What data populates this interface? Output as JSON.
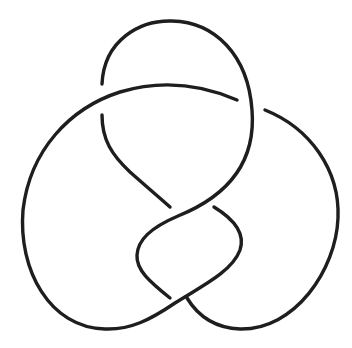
{
  "diagram": {
    "type": "knot-diagram",
    "title": "Figure-eight knot",
    "crossings": 4,
    "stroke_color": "#1e1e1e",
    "background": "#ffffff",
    "strands": [
      {
        "id": "top-loop",
        "d": "M102,84 C104,40 140,20 172,21 C215,22 248,55 252,110 C256,160 230,195 178,216 C150,228 138,240 137,255 C136,270 150,282 170,298"
      },
      {
        "id": "upper-arc",
        "d": "M237,100 C200,84 160,80 120,92 C70,108 30,150 23,210 C18,270 50,328 105,329 C130,330 150,320 175,303 C200,287 232,272 240,250 C246,232 232,218 214,207"
      },
      {
        "id": "left-inner",
        "d": "M102,115 C102,140 112,155 130,172 C148,188 160,198 170,207"
      },
      {
        "id": "right-arc",
        "d": "M265,110 C310,128 340,170 338,218 C336,270 295,330 240,329 C215,328 198,316 187,298"
      }
    ]
  }
}
